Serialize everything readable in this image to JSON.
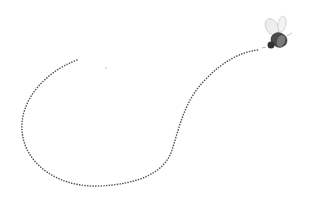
{
  "scene": {
    "description": "Illustration of a bee with a dotted flight path",
    "background": "#ffffff",
    "path_color": "#555555",
    "bee_body_color": "#4a4a4a",
    "bee_wing_color": "#c8c8c8",
    "stray_dot_color": "#bbbbbb"
  }
}
